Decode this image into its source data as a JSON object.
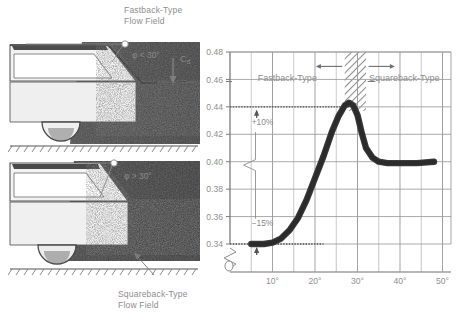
{
  "figure": {
    "background_color": "#ffffff",
    "ink_color": "#8f8f8f",
    "curve_color": "#3b3b3b"
  },
  "photos": {
    "top": {
      "caption": "Fastback-Type\nFlow Field",
      "angle_label": "φ < 30°",
      "force_label": "C",
      "force_label_sub": "d",
      "alt": "fastback-car-flow-visualization"
    },
    "bottom": {
      "caption": "Squareback-Type\nFlow Field",
      "angle_label": "φ > 30°",
      "alt": "squareback-car-flow-visualization"
    }
  },
  "chart_data": {
    "type": "line",
    "title": "",
    "xlabel": "",
    "ylabel": "",
    "xlim": [
      0,
      52
    ],
    "ylim": [
      0.33,
      0.48
    ],
    "axis_break_y": true,
    "grid": true,
    "y_ticks": [
      0.34,
      0.36,
      0.38,
      0.4,
      0.42,
      0.44,
      0.46,
      0.48
    ],
    "y_tick_labels": [
      "0.34",
      "0.36",
      "0.38",
      "0.40",
      "0.42",
      "0.44",
      "0.46",
      "0.48"
    ],
    "x_ticks": [
      10,
      20,
      30,
      40,
      50
    ],
    "x_tick_labels": [
      "10°",
      "20°",
      "30°",
      "40°",
      "50°"
    ],
    "series": [
      {
        "name": "Cd vs backlight angle",
        "x": [
          5.0,
          8.0,
          10.0,
          12.0,
          14.0,
          16.0,
          18.0,
          20.0,
          22.0,
          24.0,
          25.5,
          27.0,
          28.0,
          29.0,
          30.0,
          31.0,
          32.0,
          33.5,
          35.0,
          37.0,
          40.0,
          44.0,
          48.0
        ],
        "y": [
          0.34,
          0.34,
          0.341,
          0.344,
          0.35,
          0.359,
          0.372,
          0.388,
          0.404,
          0.422,
          0.433,
          0.441,
          0.443,
          0.441,
          0.434,
          0.421,
          0.41,
          0.403,
          0.4,
          0.399,
          0.399,
          0.399,
          0.4
        ]
      }
    ],
    "annotations": [
      {
        "name": "plus-ten-percent",
        "text": "+10%",
        "x": 6.5,
        "y": 0.427,
        "arrow": "down",
        "ref_level": 0.44
      },
      {
        "name": "minus-fifteen-percent",
        "text": "−15%",
        "x": 6.5,
        "y": 0.353,
        "arrow": "down",
        "ref_level": 0.34
      }
    ],
    "regions": [
      {
        "name": "fastback-region",
        "label": "Fastback-Type",
        "x_range": [
          0,
          27
        ],
        "arrow": "left"
      },
      {
        "name": "transition-band",
        "label": "",
        "x_range": [
          27,
          32
        ],
        "hatched": true
      },
      {
        "name": "squareback-region",
        "label": "Squareback-Type",
        "x_range": [
          32,
          52
        ],
        "arrow": "right"
      }
    ],
    "reference_lines": [
      {
        "name": "upper-reference-0.44",
        "y": 0.44,
        "style": "dotted"
      },
      {
        "name": "lower-reference-0.34",
        "y": 0.34,
        "style": "dotted"
      }
    ]
  }
}
